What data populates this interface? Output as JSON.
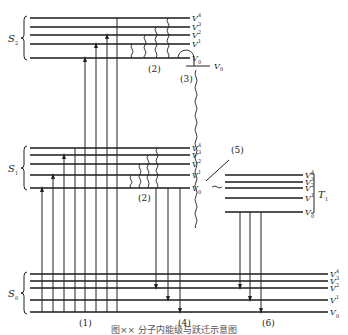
{
  "diagram": {
    "caption": "图×× 分子内能级与跃迁示意图",
    "states": [
      {
        "id": "S2",
        "label": "S",
        "sub": "2",
        "x1": 30,
        "x2": 190,
        "levels_y": [
          18,
          27,
          35,
          44,
          58
        ],
        "vib_labels": [
          "V4",
          "V3",
          "V2",
          "V1",
          "V0"
        ]
      },
      {
        "id": "S1",
        "label": "S",
        "sub": "1",
        "x1": 30,
        "x2": 190,
        "levels_y": [
          148,
          155,
          164,
          175,
          188
        ],
        "vib_labels": [
          "V4",
          "V3",
          "V2",
          "V1",
          "V0"
        ]
      },
      {
        "id": "T1",
        "label": "T",
        "sub": "1",
        "x1": 225,
        "x2": 303,
        "levels_y": [
          175,
          182,
          188,
          198,
          212
        ],
        "vib_labels": [
          "V4",
          "V3",
          "V2",
          "V1",
          "V0"
        ]
      },
      {
        "id": "S0",
        "label": "S",
        "sub": "0",
        "x1": 30,
        "x2": 328,
        "levels_y": [
          274,
          281,
          288,
          300,
          312
        ],
        "vib_labels": [
          "V4",
          "V3",
          "V2",
          "V1",
          "V0"
        ]
      }
    ],
    "process_labels": [
      {
        "id": "1",
        "text": "(1)",
        "x": 79,
        "y": 326,
        "meaning": "absorption"
      },
      {
        "id": "2a",
        "text": "(2)",
        "x": 148,
        "y": 72,
        "meaning": "vibrational relaxation in S2"
      },
      {
        "id": "2b",
        "text": "(2)",
        "x": 138,
        "y": 201,
        "meaning": "vibrational relaxation in S1"
      },
      {
        "id": "3",
        "text": "(3)",
        "x": 180,
        "y": 82,
        "meaning": "internal conversion"
      },
      {
        "id": "4",
        "text": "(4)",
        "x": 178,
        "y": 326,
        "meaning": "fluorescence"
      },
      {
        "id": "5",
        "text": "(5)",
        "x": 231,
        "y": 153,
        "meaning": "intersystem crossing"
      },
      {
        "id": "6",
        "text": "(6)",
        "x": 262,
        "y": 326,
        "meaning": "phosphorescence"
      }
    ],
    "ic_v0_label": {
      "text": "V",
      "sub": "0",
      "x": 214,
      "y": 69
    },
    "colors": {
      "line": "#1a1a1a",
      "background": "#ffffff"
    }
  }
}
